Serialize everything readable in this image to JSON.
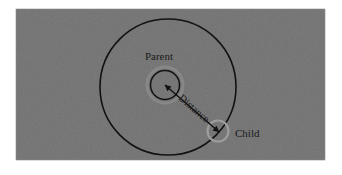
{
  "figure": {
    "type": "geometry-diagram",
    "canvas": {
      "width": 342,
      "height": 175,
      "background": "#ffffff"
    },
    "panel": {
      "name": "diagram-panel",
      "x": 16,
      "y": 9,
      "width": 309,
      "height": 151,
      "fill": "#737373",
      "noise": true
    },
    "colors": {
      "panel_gray": "#737373",
      "stroke_black": "#121212",
      "halo_light": "#9d9d9d",
      "label_text": "#1a1a1a"
    },
    "shapes": {
      "parent_circle": {
        "label": "Parent",
        "cx": 168,
        "cy": 87,
        "r": 68,
        "stroke": "#121212",
        "stroke_width": 1.6,
        "fill": "none"
      },
      "center_circle": {
        "label": "",
        "cx": 165,
        "cy": 85,
        "r": 14.5,
        "stroke": "#121212",
        "stroke_width": 1.5,
        "fill": "none",
        "halo_r": 18,
        "halo_stroke": "#8e8e8e"
      },
      "child_circle": {
        "label": "Child",
        "cx": 218,
        "cy": 131,
        "r": 10.5,
        "stroke": "#9d9d9d",
        "stroke_width": 2.2,
        "fill": "none"
      },
      "distance_arrow": {
        "label": "Distance",
        "x1": 165,
        "y1": 85,
        "x2": 219,
        "y2": 132,
        "stroke": "#121212",
        "stroke_width": 1.5,
        "arrowheads": "both"
      }
    },
    "labels": [
      {
        "name": "parent-label",
        "text": "Parent",
        "x": 159,
        "y": 60,
        "anchor": "middle",
        "rotation": 0,
        "font_size": 11
      },
      {
        "name": "distance-label",
        "text": "Distance",
        "x": 178,
        "y": 99,
        "anchor": "start",
        "rotation": 41,
        "font_size": 10.5
      },
      {
        "name": "child-label",
        "text": "Child",
        "x": 235,
        "y": 137,
        "anchor": "start",
        "rotation": 0,
        "font_size": 11
      }
    ]
  }
}
